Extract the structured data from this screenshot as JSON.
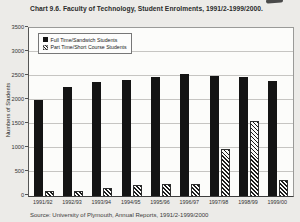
{
  "page": {
    "title": "Chart 9.6. Faculty of Technology, Student Enrolments, 1991/2-1999/2000.",
    "source": "Source: University of Plymouth, Annual Reports, 1991/2-1999/2000"
  },
  "colors": {
    "paper": "#ecebe8",
    "plot_background": "#fcfcfa",
    "solid_bar": "#141414",
    "hatch_stripe": "#1a1a1a",
    "gridline": "#c6c5c2"
  },
  "chart_data": {
    "type": "bar",
    "title": "Chart 9.6. Faculty of Technology, Student Enrolments, 1991/2-1999/2000.",
    "categories": [
      "1991/92",
      "1992/93",
      "1993/94",
      "1994/95",
      "1995/96",
      "1996/97",
      "1997/98",
      "1998/99",
      "1999/00"
    ],
    "series": [
      {
        "name": "Full Time/Sandwich Students",
        "style": "solid",
        "color": "#141414",
        "values": [
          2000,
          2280,
          2380,
          2420,
          2480,
          2540,
          2500,
          2480,
          2400
        ]
      },
      {
        "name": "Part Time/Short Course Students",
        "style": "hatched",
        "color": "#1a1a1a",
        "values": [
          110,
          100,
          160,
          230,
          250,
          250,
          980,
          1560,
          330
        ]
      }
    ],
    "xlabel": "",
    "ylabel": "Numbers of Students",
    "ylim": [
      0,
      3500
    ],
    "ytick_step": 500,
    "yticks": [
      0,
      500,
      1000,
      1500,
      2000,
      2500,
      3000,
      3500
    ],
    "grid": true,
    "legend_position": "top-left-inside",
    "source": "Source: University of Plymouth, Annual Reports, 1991/2-1999/2000"
  }
}
